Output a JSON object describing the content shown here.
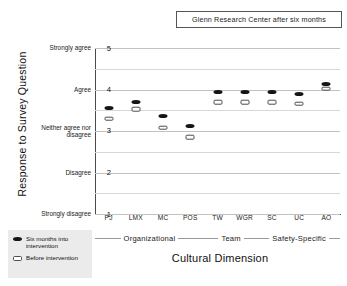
{
  "chart_data": {
    "type": "scatter",
    "title": "Glenn Research Center after six months",
    "xlabel": "Cultural Dimension",
    "ylabel": "Response to Survey Question",
    "categories": [
      "PJ",
      "LMX",
      "MC",
      "POS",
      "TW",
      "WGR",
      "SC",
      "UC",
      "AO"
    ],
    "ylim": [
      1,
      5
    ],
    "yticks": [
      {
        "value": 5,
        "label": "5",
        "words": "Strongly agree"
      },
      {
        "value": 4,
        "label": "4",
        "words": "Agree"
      },
      {
        "value": 3,
        "label": "3",
        "words": "Neither agree nor disagree"
      },
      {
        "value": 2,
        "label": "2",
        "words": "Disagree"
      },
      {
        "value": 1,
        "label": "1",
        "words": "Strongly disagree"
      }
    ],
    "grid": true,
    "legend_position": "lower-left-outside",
    "series": [
      {
        "name": "Six months into intervention",
        "marker": "filled-ellipse",
        "color": "#151515",
        "values": [
          3.56,
          3.7,
          3.36,
          3.13,
          3.95,
          3.95,
          3.95,
          3.9,
          4.13
        ]
      },
      {
        "name": "Before intervention",
        "marker": "hollow-rect",
        "color": "#4d4d4d",
        "values": [
          3.3,
          3.52,
          3.08,
          2.85,
          3.69,
          3.69,
          3.69,
          3.66,
          4.02
        ]
      }
    ],
    "groups": [
      {
        "name": "Organizational",
        "categories": [
          "PJ",
          "LMX",
          "MC",
          "POS"
        ]
      },
      {
        "name": "Team",
        "categories": [
          "TW",
          "WGR"
        ]
      },
      {
        "name": "Safety-Specific",
        "categories": [
          "SC",
          "UC",
          "AO"
        ]
      }
    ]
  }
}
